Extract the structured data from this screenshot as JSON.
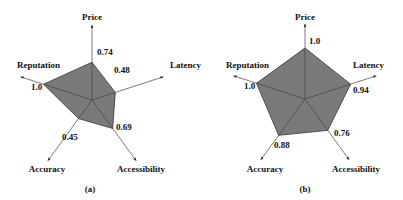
{
  "chart_data": [
    {
      "type": "radar",
      "caption": "(a)",
      "axes": [
        "Price",
        "Latency",
        "Accessibility",
        "Accuracy",
        "Reputation"
      ],
      "values": [
        0.74,
        0.48,
        0.69,
        0.45,
        1.0
      ],
      "value_labels": [
        "0.74",
        "0.48",
        "0.69",
        "0.45",
        "1.0"
      ],
      "range": [
        0,
        1
      ],
      "fill_color": "#7a7a7a",
      "grid": false
    },
    {
      "type": "radar",
      "caption": "(b)",
      "axes": [
        "Price",
        "Latency",
        "Accessibility",
        "Accuracy",
        "Reputation"
      ],
      "values": [
        1.0,
        0.94,
        0.76,
        0.88,
        1.0
      ],
      "value_labels": [
        "1.0",
        "0.94",
        "0.76",
        "0.88",
        "1.0"
      ],
      "range": [
        0,
        1
      ],
      "fill_color": "#7a7a7a",
      "grid": false
    }
  ]
}
